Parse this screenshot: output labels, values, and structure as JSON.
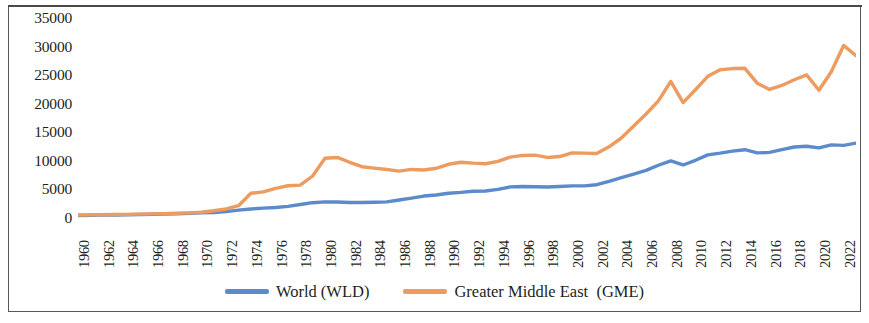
{
  "chart_data": {
    "type": "line",
    "title": "",
    "xlabel": "",
    "ylabel": "",
    "ylim": [
      0,
      35000
    ],
    "xlim": [
      1960,
      2023
    ],
    "grid": false,
    "legend_position": "bottom-center",
    "y_ticks": [
      "35000",
      "30000",
      "25000",
      "20000",
      "15000",
      "10000",
      "5000",
      "0"
    ],
    "y_tick_values": [
      35000,
      30000,
      25000,
      20000,
      15000,
      10000,
      5000,
      0
    ],
    "x_ticks": [
      "1960",
      "1962",
      "1964",
      "1966",
      "1968",
      "1970",
      "1972",
      "1974",
      "1976",
      "1978",
      "1980",
      "1982",
      "1984",
      "1986",
      "1988",
      "1990",
      "1992",
      "1994",
      "1996",
      "1998",
      "2000",
      "2002",
      "2004",
      "2006",
      "2008",
      "2010",
      "2012",
      "2014",
      "2016",
      "2018",
      "2020",
      "2022"
    ],
    "x": [
      1960,
      1961,
      1962,
      1963,
      1964,
      1965,
      1966,
      1967,
      1968,
      1969,
      1970,
      1971,
      1972,
      1973,
      1974,
      1975,
      1976,
      1977,
      1978,
      1979,
      1980,
      1981,
      1982,
      1983,
      1984,
      1985,
      1986,
      1987,
      1988,
      1989,
      1990,
      1991,
      1992,
      1993,
      1994,
      1995,
      1996,
      1997,
      1998,
      1999,
      2000,
      2001,
      2002,
      2003,
      2004,
      2005,
      2006,
      2007,
      2008,
      2009,
      2010,
      2011,
      2012,
      2013,
      2014,
      2015,
      2016,
      2017,
      2018,
      2019,
      2020,
      2021,
      2022,
      2023
    ],
    "series": [
      {
        "name": "World (WLD)",
        "code": "WLD",
        "color": "#5B8BCB",
        "values": [
          450,
          470,
          500,
          530,
          570,
          610,
          660,
          690,
          740,
          810,
          890,
          970,
          1120,
          1370,
          1580,
          1720,
          1830,
          2030,
          2370,
          2680,
          2820,
          2800,
          2720,
          2700,
          2760,
          2830,
          3150,
          3470,
          3840,
          4030,
          4340,
          4480,
          4690,
          4720,
          5010,
          5440,
          5520,
          5480,
          5420,
          5520,
          5620,
          5620,
          5830,
          6420,
          7080,
          7690,
          8330,
          9230,
          9990,
          9280,
          10100,
          11050,
          11350,
          11700,
          11950,
          11400,
          11480,
          11950,
          12430,
          12560,
          12260,
          12790,
          12710,
          13100
        ]
      },
      {
        "name": "Greater Middle East  (GME)",
        "code": "GME",
        "color": "#ED9B5E",
        "values": [
          520,
          540,
          560,
          600,
          640,
          680,
          720,
          760,
          820,
          900,
          1000,
          1260,
          1580,
          2150,
          4320,
          4580,
          5180,
          5640,
          5750,
          7350,
          10450,
          10600,
          9750,
          8980,
          8720,
          8490,
          8200,
          8500,
          8400,
          8700,
          9400,
          9750,
          9600,
          9500,
          9900,
          10650,
          10950,
          11000,
          10600,
          10750,
          11400,
          11350,
          11300,
          12450,
          14000,
          16100,
          18200,
          20500,
          23900,
          20200,
          22450,
          24800,
          25950,
          26150,
          26200,
          23600,
          22500,
          23200,
          24200,
          25050,
          22350,
          25600,
          30200,
          28400
        ]
      }
    ]
  },
  "legend": {
    "entries": [
      {
        "label": "World (WLD)",
        "color": "#5B8BCB",
        "swatch_name": "legend-swatch-world"
      },
      {
        "label": "Greater Middle East  (GME)",
        "color": "#ED9B5E",
        "swatch_name": "legend-swatch-gme"
      }
    ]
  }
}
